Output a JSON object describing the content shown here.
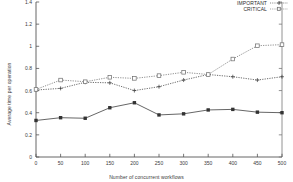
{
  "chart_data": {
    "type": "line",
    "title": "",
    "xlabel": "Number of concurrent workflows",
    "ylabel": "Average time per operation",
    "xlim": [
      0,
      500
    ],
    "ylim": [
      0,
      1.4
    ],
    "xticks": [
      0,
      50,
      100,
      150,
      200,
      250,
      300,
      350,
      400,
      450,
      500
    ],
    "xtick_labels": [
      "0",
      "50",
      "100",
      "150",
      "200",
      "250",
      "300",
      "350",
      "400",
      "450",
      "500"
    ],
    "yticks": [
      0,
      0.2,
      0.4,
      0.6,
      0.8,
      1,
      1.2,
      1.4
    ],
    "ytick_labels": [
      "0",
      "0.2",
      "0.4",
      "0.6",
      "0.8",
      "1",
      "1.2",
      "1.4"
    ],
    "grid": false,
    "legend_position": "top-right",
    "x": [
      0,
      50,
      100,
      150,
      200,
      250,
      300,
      350,
      400,
      450,
      500
    ],
    "series": [
      {
        "name": "NORMAL",
        "marker": "square-filled",
        "linestyle": "solid",
        "color": "#333333",
        "values": [
          0.33,
          0.355,
          0.35,
          0.445,
          0.49,
          0.38,
          0.39,
          0.425,
          0.43,
          0.405,
          0.4
        ]
      },
      {
        "name": "IMPORTANT",
        "marker": "plus",
        "linestyle": "dotted",
        "color": "#3a3a3a",
        "values": [
          0.605,
          0.62,
          0.675,
          0.67,
          0.6,
          0.635,
          0.695,
          0.745,
          0.725,
          0.695,
          0.725
        ]
      },
      {
        "name": "CRITICAL",
        "marker": "square-open",
        "linestyle": "dotted",
        "color": "#6a6a6a",
        "values": [
          0.61,
          0.695,
          0.68,
          0.72,
          0.71,
          0.735,
          0.765,
          0.745,
          0.885,
          1.005,
          1.015
        ]
      }
    ]
  },
  "legend": {
    "entries": [
      {
        "label": "NORMAL"
      },
      {
        "label": "IMPORTANT"
      },
      {
        "label": "CRITICAL"
      }
    ]
  }
}
